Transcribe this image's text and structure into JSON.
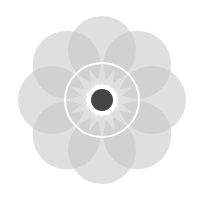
{
  "graphic": {
    "name": "flower-of-circles",
    "center": [
      102,
      100
    ],
    "petal_count": 8,
    "petal_distance": 50,
    "petal_radius": 34,
    "colors": {
      "background": "#ffffff",
      "petal": "#c4c4c4",
      "petal_opacity": 0.55,
      "ring": "#ffffff",
      "star": "#e2e2e2",
      "octagon": "#ffffff",
      "dot": "#454545"
    },
    "ring_radius": 37,
    "octagon_radius": 16,
    "dot_radius": 11
  }
}
